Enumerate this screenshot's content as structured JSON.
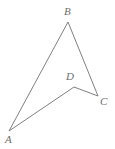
{
  "figure": {
    "kind": "geometry-diagram",
    "shape_name": "quadrilateral ABCD",
    "background_color": "#ffffff",
    "stroke_color": "#808080",
    "stroke_width": 1,
    "label_color": "#6e6e6e",
    "label_font_size": 11,
    "label_style": "italic-serif",
    "canvas": {
      "width": 115,
      "height": 149
    },
    "vertices": [
      {
        "id": "A",
        "label": "A",
        "x": 9,
        "y": 131,
        "label_x": 5,
        "label_y": 134
      },
      {
        "id": "B",
        "label": "B",
        "x": 68,
        "y": 22,
        "label_x": 64,
        "label_y": 6
      },
      {
        "id": "C",
        "label": "C",
        "x": 98,
        "y": 96,
        "label_x": 100,
        "label_y": 96
      },
      {
        "id": "D",
        "label": "D",
        "x": 74,
        "y": 87,
        "label_x": 66,
        "label_y": 71
      }
    ],
    "edges": [
      {
        "id": "AB",
        "from": "A",
        "to": "B"
      },
      {
        "id": "BC",
        "from": "B",
        "to": "C"
      },
      {
        "id": "CD",
        "from": "C",
        "to": "D"
      },
      {
        "id": "DA",
        "from": "D",
        "to": "A"
      }
    ],
    "path_points": "9,131 68,22 98,96 74,87",
    "label_A": "A",
    "label_B": "B",
    "label_C": "C",
    "label_D": "D"
  }
}
